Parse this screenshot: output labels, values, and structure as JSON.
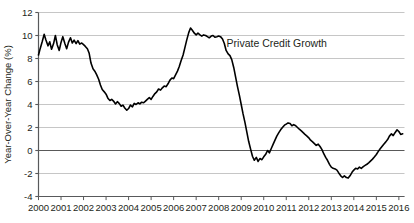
{
  "chart_data": {
    "type": "line",
    "title": "",
    "subtitle": "",
    "xlabel": "",
    "ylabel": "Year-Over-Year Change (%)",
    "xlim": [
      2000.0,
      2016.25
    ],
    "ylim": [
      -4,
      12
    ],
    "yticks": [
      -4,
      -2,
      0,
      2,
      4,
      6,
      8,
      10,
      12
    ],
    "ytick_labels": [
      "-4",
      "-2",
      "0",
      "2",
      "4",
      "6",
      "8",
      "10",
      "12"
    ],
    "xticks": [
      2000,
      2001,
      2002,
      2003,
      2004,
      2005,
      2006,
      2007,
      2008,
      2009,
      2010,
      2011,
      2012,
      2013,
      2014,
      2015,
      2016
    ],
    "xtick_labels": [
      "2000",
      "2001",
      "2002",
      "2003",
      "2004",
      "2005",
      "2006",
      "2007",
      "2008",
      "2009",
      "2010",
      "2011",
      "2012",
      "2013",
      "2014",
      "2015",
      "2016"
    ],
    "grid": true,
    "grid_color": "#b8b8b8",
    "zero_line_color": "#595959",
    "axis_color": "#58595b",
    "legend": "none",
    "legend_position": "inline-annotation",
    "annotations": [
      {
        "text": "Private Credit Growth",
        "x": 2008.35,
        "y": 9.0
      }
    ],
    "series": [
      {
        "name": "Private Credit Growth",
        "color": "#000000",
        "line_width": 1.6,
        "x": [
          2000.0,
          2000.08,
          2000.17,
          2000.25,
          2000.33,
          2000.42,
          2000.5,
          2000.58,
          2000.67,
          2000.75,
          2000.83,
          2000.92,
          2001.0,
          2001.08,
          2001.17,
          2001.25,
          2001.33,
          2001.42,
          2001.5,
          2001.58,
          2001.67,
          2001.75,
          2001.83,
          2001.92,
          2002.0,
          2002.08,
          2002.17,
          2002.25,
          2002.33,
          2002.42,
          2002.5,
          2002.58,
          2002.67,
          2002.75,
          2002.83,
          2002.92,
          2003.0,
          2003.08,
          2003.17,
          2003.25,
          2003.33,
          2003.42,
          2003.5,
          2003.58,
          2003.67,
          2003.75,
          2003.83,
          2003.92,
          2004.0,
          2004.08,
          2004.17,
          2004.25,
          2004.33,
          2004.42,
          2004.5,
          2004.58,
          2004.67,
          2004.75,
          2004.83,
          2004.92,
          2005.0,
          2005.08,
          2005.17,
          2005.25,
          2005.33,
          2005.42,
          2005.5,
          2005.58,
          2005.67,
          2005.75,
          2005.83,
          2005.92,
          2006.0,
          2006.08,
          2006.17,
          2006.25,
          2006.33,
          2006.42,
          2006.5,
          2006.58,
          2006.67,
          2006.75,
          2006.83,
          2006.92,
          2007.0,
          2007.08,
          2007.17,
          2007.25,
          2007.33,
          2007.42,
          2007.5,
          2007.58,
          2007.67,
          2007.75,
          2007.83,
          2007.92,
          2008.0,
          2008.08,
          2008.17,
          2008.25,
          2008.33,
          2008.42,
          2008.5,
          2008.58,
          2008.67,
          2008.75,
          2008.83,
          2008.92,
          2009.0,
          2009.08,
          2009.17,
          2009.25,
          2009.33,
          2009.42,
          2009.5,
          2009.58,
          2009.67,
          2009.75,
          2009.83,
          2009.92,
          2010.0,
          2010.08,
          2010.17,
          2010.25,
          2010.33,
          2010.42,
          2010.5,
          2010.58,
          2010.67,
          2010.75,
          2010.83,
          2010.92,
          2011.0,
          2011.08,
          2011.17,
          2011.25,
          2011.33,
          2011.42,
          2011.5,
          2011.58,
          2011.67,
          2011.75,
          2011.83,
          2011.92,
          2012.0,
          2012.08,
          2012.17,
          2012.25,
          2012.33,
          2012.42,
          2012.5,
          2012.58,
          2012.67,
          2012.75,
          2012.83,
          2012.92,
          2013.0,
          2013.08,
          2013.17,
          2013.25,
          2013.33,
          2013.42,
          2013.5,
          2013.58,
          2013.67,
          2013.75,
          2013.83,
          2013.92,
          2014.0,
          2014.08,
          2014.17,
          2014.25,
          2014.33,
          2014.42,
          2014.5,
          2014.58,
          2014.67,
          2014.75,
          2014.83,
          2014.92,
          2015.0,
          2015.08,
          2015.17,
          2015.25,
          2015.33,
          2015.42,
          2015.5,
          2015.58,
          2015.67,
          2015.75,
          2015.83,
          2015.92,
          2016.0,
          2016.08,
          2016.17
        ],
        "y": [
          8.3,
          8.9,
          9.5,
          10.1,
          9.6,
          9.1,
          9.45,
          8.8,
          9.3,
          10.0,
          9.2,
          8.7,
          9.4,
          9.9,
          9.3,
          8.85,
          9.4,
          9.8,
          9.35,
          9.6,
          9.3,
          9.55,
          9.25,
          9.35,
          9.2,
          9.05,
          8.85,
          8.45,
          7.6,
          7.1,
          6.9,
          6.6,
          6.2,
          5.7,
          5.3,
          5.1,
          4.9,
          4.55,
          4.35,
          4.45,
          4.3,
          4.05,
          4.25,
          4.1,
          3.85,
          3.95,
          3.7,
          3.5,
          3.65,
          3.95,
          3.8,
          4.1,
          4.0,
          4.15,
          4.05,
          4.2,
          4.15,
          4.3,
          4.45,
          4.6,
          4.45,
          4.7,
          4.95,
          5.1,
          5.35,
          5.25,
          5.45,
          5.6,
          5.55,
          5.8,
          6.1,
          6.3,
          6.25,
          6.55,
          6.9,
          7.3,
          7.8,
          8.3,
          8.95,
          9.6,
          10.25,
          10.65,
          10.45,
          10.2,
          10.05,
          10.2,
          10.05,
          9.95,
          10.05,
          10.0,
          9.9,
          9.8,
          9.95,
          10.0,
          9.85,
          9.9,
          9.95,
          9.9,
          9.7,
          9.3,
          8.7,
          8.4,
          8.25,
          7.9,
          7.2,
          6.4,
          5.6,
          4.8,
          4.0,
          3.2,
          2.4,
          1.6,
          0.8,
          0.1,
          -0.5,
          -0.85,
          -0.6,
          -0.95,
          -0.7,
          -0.8,
          -0.55,
          -0.35,
          0.0,
          -0.2,
          0.15,
          0.55,
          0.9,
          1.25,
          1.55,
          1.8,
          2.0,
          2.2,
          2.3,
          2.4,
          2.35,
          2.15,
          2.25,
          2.15,
          2.0,
          1.85,
          1.7,
          1.55,
          1.4,
          1.25,
          1.1,
          0.9,
          0.75,
          0.6,
          0.45,
          0.55,
          0.35,
          0.1,
          -0.3,
          -0.6,
          -0.85,
          -1.2,
          -1.45,
          -1.55,
          -1.6,
          -1.7,
          -1.95,
          -2.2,
          -2.35,
          -2.2,
          -2.35,
          -2.4,
          -2.2,
          -1.9,
          -1.7,
          -1.55,
          -1.6,
          -1.45,
          -1.55,
          -1.4,
          -1.3,
          -1.2,
          -1.05,
          -0.9,
          -0.75,
          -0.55,
          -0.35,
          -0.1,
          0.15,
          0.35,
          0.55,
          0.75,
          0.95,
          1.25,
          1.45,
          1.3,
          1.55,
          1.8,
          1.65,
          1.4,
          1.45
        ]
      }
    ]
  }
}
